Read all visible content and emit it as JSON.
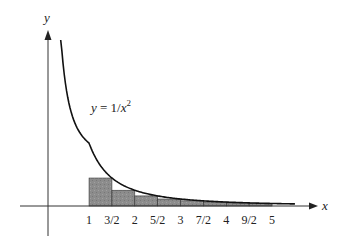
{
  "chart_data": {
    "type": "area",
    "title": "",
    "function_label": "y = 1/x²",
    "function_label_parts": {
      "lhs": "y = 1/x",
      "exp": "2"
    },
    "xlabel": "x",
    "ylabel": "y",
    "x_ticks": [
      {
        "value": 1,
        "label": "1"
      },
      {
        "value": 1.5,
        "label": "3/2"
      },
      {
        "value": 2,
        "label": "2"
      },
      {
        "value": 2.5,
        "label": "5/2"
      },
      {
        "value": 3,
        "label": "3"
      },
      {
        "value": 3.5,
        "label": "7/2"
      },
      {
        "value": 4,
        "label": "4"
      },
      {
        "value": 4.5,
        "label": "9/2"
      },
      {
        "value": 5,
        "label": "5"
      }
    ],
    "curve": {
      "function": "1/x^2",
      "x_start": 0.38,
      "x_end": 5.5
    },
    "rectangles": {
      "description": "Right-endpoint Riemann rectangles of width 1/2 on [1,5]",
      "width": 0.5,
      "intervals": [
        [
          1,
          1.5
        ],
        [
          1.5,
          2
        ],
        [
          2,
          2.5
        ],
        [
          2.5,
          3
        ],
        [
          3,
          3.5
        ],
        [
          3.5,
          4
        ],
        [
          4,
          4.5
        ],
        [
          4.5,
          5
        ]
      ],
      "heights": [
        0.444,
        0.25,
        0.16,
        0.111,
        0.082,
        0.0625,
        0.049,
        0.04
      ]
    },
    "xlim": [
      -0.1,
      5.9
    ],
    "grid": false,
    "legend": null,
    "colors": {
      "rect_fill": "#8a8a8a",
      "rect_stroke": "#333333",
      "curve": "#111111",
      "axis": "#333333"
    }
  }
}
